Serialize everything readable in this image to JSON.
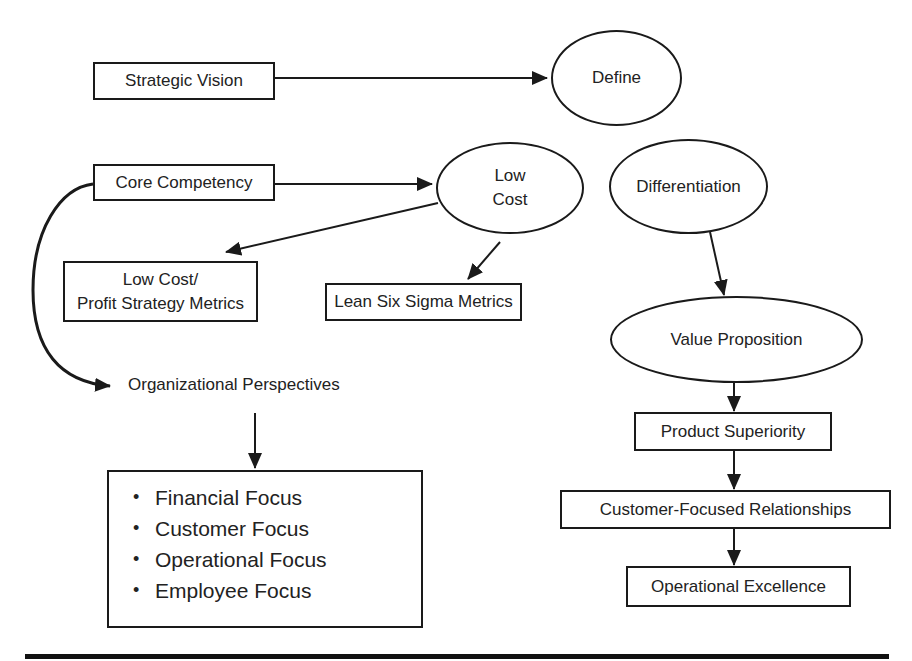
{
  "nodes": {
    "strategic_vision": "Strategic Vision",
    "define": "Define",
    "core_competency": "Core Competency",
    "low_cost_line1": "Low",
    "low_cost_line2": "Cost",
    "differentiation": "Differentiation",
    "low_cost_profit_line1": "Low Cost/",
    "low_cost_profit_line2": "Profit Strategy Metrics",
    "lean_six_sigma": "Lean Six Sigma Metrics",
    "organizational_perspectives": "Organizational Perspectives",
    "value_proposition": "Value Proposition",
    "product_superiority": "Product Superiority",
    "customer_focused": "Customer-Focused Relationships",
    "operational_excellence": "Operational Excellence"
  },
  "focus_list": [
    "Financial Focus",
    "Customer Focus",
    "Operational Focus",
    "Employee Focus"
  ],
  "edges": [
    {
      "from": "Strategic Vision",
      "to": "Define"
    },
    {
      "from": "Core Competency",
      "to": "Low Cost"
    },
    {
      "from": "Core Competency",
      "to": "Organizational Perspectives"
    },
    {
      "from": "Low Cost",
      "to": "Low Cost/Profit Strategy Metrics"
    },
    {
      "from": "Low Cost",
      "to": "Lean Six Sigma Metrics"
    },
    {
      "from": "Organizational Perspectives",
      "to": "Focus List"
    },
    {
      "from": "Differentiation",
      "to": "Value Proposition"
    },
    {
      "from": "Value Proposition",
      "to": "Product Superiority"
    },
    {
      "from": "Product Superiority",
      "to": "Customer-Focused Relationships"
    },
    {
      "from": "Customer-Focused Relationships",
      "to": "Operational Excellence"
    }
  ],
  "colors": {
    "stroke": "#1a1a1a",
    "background": "#ffffff",
    "text": "#222222"
  }
}
